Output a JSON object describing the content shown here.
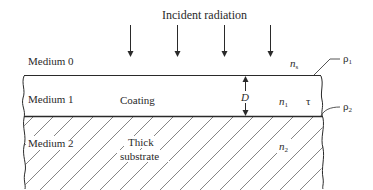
{
  "diagram": {
    "title": "Incident radiation",
    "media": [
      {
        "name": "Medium 0",
        "layer": "ambient"
      },
      {
        "name": "Medium 1",
        "layer": "Coating"
      },
      {
        "name": "Medium 2",
        "layer_line1": "Thick",
        "layer_line2": "substrate"
      }
    ],
    "symbols": {
      "ns": {
        "base": "n",
        "sub": "s"
      },
      "n1": {
        "base": "n",
        "sub": "1"
      },
      "n2": {
        "base": "n",
        "sub": "2"
      },
      "tau": "τ",
      "D": "D",
      "rho1": {
        "base": "ρ",
        "sub": "1"
      },
      "rho2": {
        "base": "ρ",
        "sub": "2"
      }
    },
    "incident_arrow_count": 4,
    "colors": {
      "line": "#2a2a2a",
      "hatch": "#555555",
      "background": "#ffffff"
    }
  }
}
